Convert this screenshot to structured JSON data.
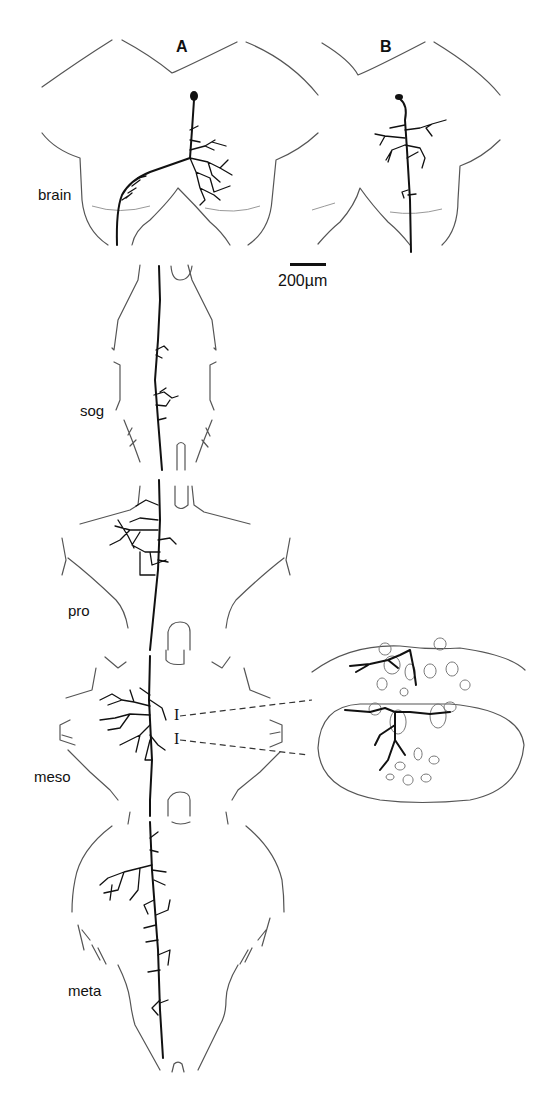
{
  "figure": {
    "panels": [
      {
        "id": "A",
        "label": "A"
      },
      {
        "id": "B",
        "label": "B"
      }
    ],
    "ganglion_labels": {
      "brain": "brain",
      "sog": "sog",
      "pro": "pro",
      "meso": "meso",
      "meta": "meta"
    },
    "scale_bar": {
      "label": "200µm"
    },
    "section_markers": [
      "I",
      "I"
    ],
    "colors": {
      "neuron": "#111111",
      "outline": "#555555",
      "background": "#ffffff"
    }
  }
}
